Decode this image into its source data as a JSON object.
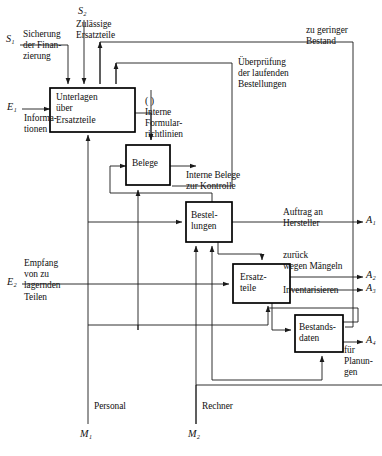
{
  "diagram": {
    "boxes": [
      {
        "id": "unterlagen",
        "label": "Unterlagen\nüber\nErsatzteile"
      },
      {
        "id": "belege",
        "label": "Belege"
      },
      {
        "id": "bestellungen",
        "label": "Bestel-\nlungen"
      },
      {
        "id": "ersatzteile",
        "label": "Ersatz-\nteile"
      },
      {
        "id": "bestandsdaten",
        "label": "Bestands-\ndaten"
      }
    ],
    "terminals": {
      "s1": "S₁",
      "s2": "S₂",
      "e1": "E₁",
      "e2": "E₂",
      "a1": "A₁",
      "a2": "A₂",
      "a3": "A₃",
      "a4": "A₄",
      "m1": "M₁",
      "m2": "M₂"
    },
    "edge_labels": {
      "sicherung": "Sicherung\nder Finan-\nzierung",
      "zulaessige": "Zulässige\nErsatzteile",
      "informationen": "Informa-\ntionen",
      "zu_geringer": "zu geringer\nBestand",
      "ueberpruefung": "Überprüfung\nder laufenden\nBestellungen",
      "interne_formular": "Interne\nFormular-\nrichtlinien",
      "interne_belege": "Interne Belege\nzur Kontrolle",
      "auftrag": "Auftrag an\nHersteller",
      "zurueck": "zurück\nwegen Mängeln",
      "inventarisieren": "Inventarisieren",
      "empfang": "Empfang\nvon zu\nlagernden\nTeilen",
      "fuer_planungen": "für\nPlanun-\ngen",
      "personal": "Personal",
      "rechner": "Rechner",
      "empty_paren": "( )"
    },
    "colors": {
      "stroke": "#1a1a1a",
      "box_stroke": "#000000",
      "background": "#ffffff",
      "text": "#111111"
    }
  }
}
